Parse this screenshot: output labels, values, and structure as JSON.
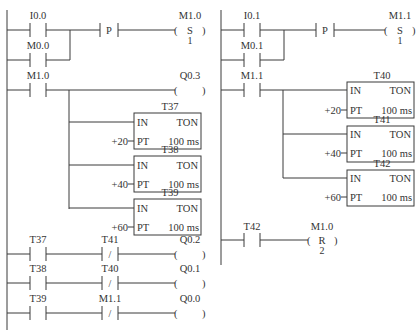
{
  "diagram": {
    "type": "ladder-logic",
    "left_network": {
      "rung1": {
        "contacts": [
          {
            "label": "I0.0",
            "type": "NO"
          },
          {
            "label": "M0.0",
            "type": "NO",
            "parallel": true
          }
        ],
        "edge": "P",
        "coil": {
          "label": "M1.0",
          "type": "S",
          "count": "1"
        }
      },
      "rung2": {
        "contact": {
          "label": "M1.0",
          "type": "NO"
        },
        "coil": {
          "label": "Q0.3",
          "type": "output"
        },
        "timers": [
          {
            "name": "T37",
            "in": "IN",
            "kind": "TON",
            "pt": "PT",
            "preset": "+20",
            "base": "100 ms"
          },
          {
            "name": "T38",
            "in": "IN",
            "kind": "TON",
            "pt": "PT",
            "preset": "+40",
            "base": "100 ms"
          },
          {
            "name": "T39",
            "in": "IN",
            "kind": "TON",
            "pt": "PT",
            "preset": "+60",
            "base": "100 ms"
          }
        ]
      },
      "rung3": {
        "contact": "T37",
        "nc_contact": "T41",
        "nc_symbol": "/",
        "coil": "Q0.2"
      },
      "rung4": {
        "contact": "T38",
        "nc_contact": "T40",
        "nc_symbol": "/",
        "coil": "Q0.1"
      },
      "rung5": {
        "contact": "T39",
        "nc_contact": "M1.1",
        "nc_symbol": "/",
        "coil": "Q0.0"
      }
    },
    "right_network": {
      "rung1": {
        "contacts": [
          {
            "label": "I0.1",
            "type": "NO"
          },
          {
            "label": "M0.1",
            "type": "NO",
            "parallel": true
          }
        ],
        "edge": "P",
        "coil": {
          "label": "M1.1",
          "type": "S",
          "count": "1"
        }
      },
      "rung2": {
        "contact": {
          "label": "M1.1",
          "type": "NO"
        },
        "timers": [
          {
            "name": "T40",
            "in": "IN",
            "kind": "TON",
            "pt": "PT",
            "preset": "+20",
            "base": "100 ms"
          },
          {
            "name": "T41",
            "in": "IN",
            "kind": "TON",
            "pt": "PT",
            "preset": "+40",
            "base": "100 ms"
          },
          {
            "name": "T42",
            "in": "IN",
            "kind": "TON",
            "pt": "PT",
            "preset": "+60",
            "base": "100 ms"
          }
        ]
      },
      "rung3": {
        "contact": "T42",
        "coil": {
          "label": "M1.0",
          "type": "R",
          "count": "2"
        }
      }
    }
  }
}
